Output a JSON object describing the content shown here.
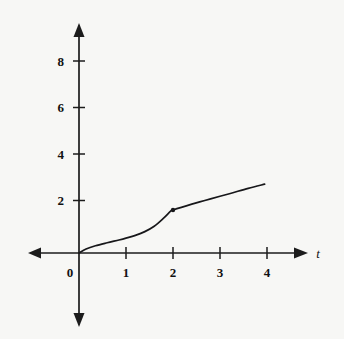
{
  "figure": {
    "background_color": "#f7f7f5",
    "ink_color": "#17171a",
    "width": 344,
    "height": 339
  },
  "chart_data": {
    "type": "line",
    "title": "",
    "subtitle": "",
    "xlabel": "t",
    "ylabel": "",
    "xlim": [
      -1.05,
      5.25
    ],
    "ylim": [
      -3.2,
      9.9
    ],
    "grid": false,
    "legend": false,
    "legend_position": "none",
    "x_ticks": [
      1,
      2,
      3,
      4
    ],
    "x_tick_labels": [
      "1",
      "2",
      "3",
      "4"
    ],
    "y_ticks": [
      2,
      4,
      6,
      8
    ],
    "y_tick_labels": [
      "2",
      "4",
      "6",
      "8"
    ],
    "origin_label": "0",
    "axis_arrows": [
      "up",
      "down",
      "left",
      "right"
    ],
    "series": [
      {
        "name": "curve",
        "style": "solid",
        "color": "#17171a",
        "points": [
          [
            0.0,
            0.0
          ],
          [
            0.15,
            0.17
          ],
          [
            0.35,
            0.31
          ],
          [
            0.6,
            0.44
          ],
          [
            0.85,
            0.56
          ],
          [
            1.0,
            0.64
          ],
          [
            1.2,
            0.76
          ],
          [
            1.4,
            0.92
          ],
          [
            1.6,
            1.15
          ],
          [
            1.8,
            1.5
          ],
          [
            1.95,
            1.8
          ],
          [
            2.0,
            1.85
          ],
          [
            2.4,
            2.1
          ],
          [
            2.8,
            2.33
          ],
          [
            3.2,
            2.55
          ],
          [
            3.6,
            2.78
          ],
          [
            3.95,
            2.96
          ]
        ]
      }
    ],
    "annotations": [
      {
        "name": "corner-point",
        "type": "dot",
        "x": 2.0,
        "y": 1.85,
        "label": ""
      }
    ]
  }
}
